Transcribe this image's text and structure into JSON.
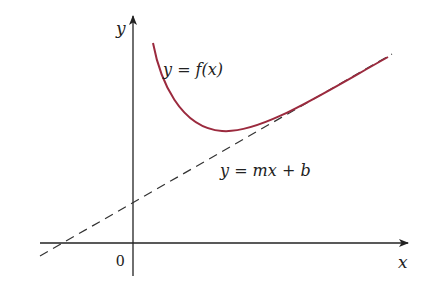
{
  "diagram": {
    "axes": {
      "x_label": "x",
      "y_label": "y",
      "origin_label": "0"
    },
    "curve": {
      "label": "y = f(x)",
      "color": "#9b2a3e"
    },
    "asymptote": {
      "label": "y = mx + b",
      "style": "dashed",
      "color": "#333333"
    },
    "axis_color": "#222222"
  }
}
